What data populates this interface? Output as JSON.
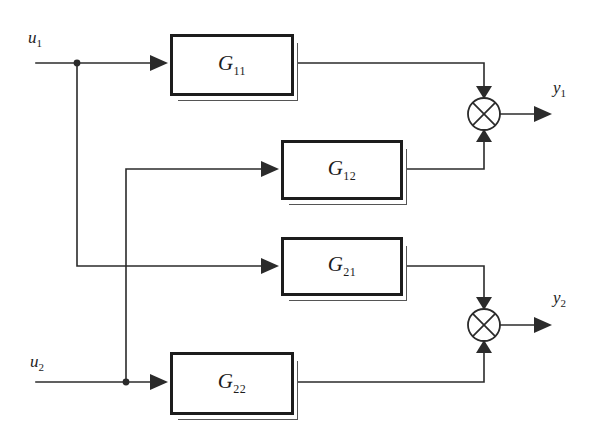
{
  "diagram": {
    "ink_color": "#1c1c1c",
    "background": "#ffffff",
    "blocks": [
      {
        "id": "G11",
        "base": "G",
        "subscript": "11",
        "x": 170,
        "y": 34,
        "w": 124,
        "h": 62
      },
      {
        "id": "G12",
        "base": "G",
        "subscript": "12",
        "x": 281,
        "y": 140,
        "w": 122,
        "h": 60
      },
      {
        "id": "G21",
        "base": "G",
        "subscript": "21",
        "x": 281,
        "y": 237,
        "w": 122,
        "h": 59
      },
      {
        "id": "G22",
        "base": "G",
        "subscript": "22",
        "x": 170,
        "y": 352,
        "w": 124,
        "h": 63
      }
    ],
    "inputs": [
      {
        "id": "u1",
        "base": "u",
        "subscript": "1",
        "label_x": 28,
        "label_y": 28,
        "line_y": 63
      },
      {
        "id": "u2",
        "base": "u",
        "subscript": "2",
        "label_x": 30,
        "label_y": 352,
        "line_y": 382
      }
    ],
    "outputs": [
      {
        "id": "y1",
        "base": "y",
        "subscript": "1",
        "label_x": 553,
        "label_y": 78,
        "line_y": 114
      },
      {
        "id": "y2",
        "base": "y",
        "subscript": "2",
        "label_x": 553,
        "label_y": 288,
        "line_y": 325
      }
    ],
    "summing_junctions": [
      {
        "id": "sum-y1",
        "cx": 484,
        "cy": 114,
        "r": 16,
        "glyph": "cross"
      },
      {
        "id": "sum-y2",
        "cx": 484,
        "cy": 325,
        "r": 16,
        "glyph": "cross"
      }
    ],
    "branch_dots": [
      {
        "id": "u1-branch",
        "cx": 77,
        "cy": 63,
        "r": 3.4
      },
      {
        "id": "u2-branch",
        "cx": 126,
        "cy": 382,
        "r": 3.4
      }
    ],
    "routing_notes": {
      "u1_to_G11": "u1 horizontal at y=63 into G11 input",
      "u1_to_G21": "u1 branches down at x=77 to y=266, right into G21",
      "u2_to_G22": "u2 horizontal at y=382 into G22 input",
      "u2_to_G12": "u2 branches up at x=126 to y=169, right into G12",
      "G11_to_sum1": "G11 out at y=63 right to x=484, down into top of sum-y1",
      "G12_to_sum1": "G12 out at y=169 right to x=484, up into bottom of sum-y1",
      "G21_to_sum2": "G21 out at y=266 right to x=484, down into top of sum-y2",
      "G22_to_sum2": "G22 out at y=382 right to x=484, up into bottom of sum-y2"
    }
  }
}
